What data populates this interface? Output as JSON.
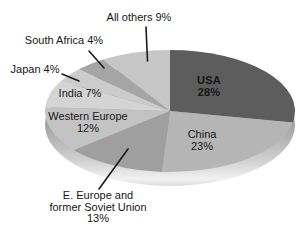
{
  "chart_data": {
    "type": "pie",
    "style": "3d-ellipse",
    "title": "",
    "categories": [
      "USA",
      "China",
      "E. Europe and former Soviet Union",
      "Western Europe",
      "India",
      "Japan",
      "South Africa",
      "All others"
    ],
    "values": [
      28,
      23,
      13,
      12,
      7,
      4,
      4,
      9
    ],
    "unit": "%",
    "colors": [
      "#5d5d5d",
      "#b5b5b5",
      "#9f9f9f",
      "#c3c3c3",
      "#d4d4d4",
      "#cccccc",
      "#a5a5a5",
      "#c6c6c6"
    ],
    "slice_ids": [
      "usa",
      "china",
      "e-europe-former-soviet-union",
      "western-europe",
      "india",
      "japan",
      "south-africa",
      "all-others"
    ],
    "start_angle_deg": 0,
    "direction": "clockwise",
    "legend": "none",
    "labels_on_chart": true
  },
  "labels": {
    "usa": [
      "USA",
      "28%"
    ],
    "china": [
      "China",
      "23%"
    ],
    "all_others": [
      "All others 9%"
    ],
    "south_africa": [
      "South Africa 4%"
    ],
    "japan": [
      "Japan 4%"
    ],
    "india": [
      "India 7%"
    ],
    "western_europe": [
      "Western Europe",
      "12%"
    ],
    "e_europe": [
      "E. Europe and",
      "former Soviet Union",
      "13%"
    ]
  }
}
